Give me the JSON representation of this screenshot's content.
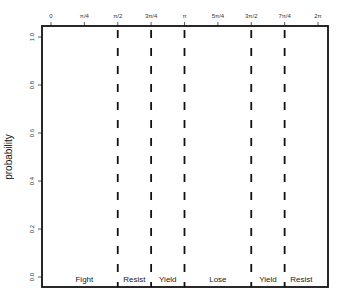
{
  "chart_data": {
    "type": "line",
    "title": "",
    "xlabel": "",
    "ylabel": "probability",
    "xlim": [
      0,
      6.2832
    ],
    "ylim": [
      0,
      1
    ],
    "grid": false,
    "legend": null,
    "x_ticks": [
      {
        "value": 0,
        "label": "0"
      },
      {
        "value": 0.7854,
        "label": "π/4"
      },
      {
        "value": 1.5708,
        "label": "π/2"
      },
      {
        "value": 2.3562,
        "label": "3π/4"
      },
      {
        "value": 3.1416,
        "label": "π"
      },
      {
        "value": 3.927,
        "label": "5π/4"
      },
      {
        "value": 4.7124,
        "label": "3π/2"
      },
      {
        "value": 5.4978,
        "label": "7π/4"
      },
      {
        "value": 6.2832,
        "label": "2π"
      }
    ],
    "y_ticks": [
      {
        "value": 0.0,
        "label": "0.0"
      },
      {
        "value": 0.2,
        "label": "0.2"
      },
      {
        "value": 0.4,
        "label": "0.4"
      },
      {
        "value": 0.6,
        "label": "0.6"
      },
      {
        "value": 0.8,
        "label": "0.8"
      },
      {
        "value": 1.0,
        "label": "1.0"
      }
    ],
    "vertical_dashed_lines": [
      1.5708,
      2.3562,
      3.1416,
      4.7124,
      5.4978
    ],
    "regions": [
      {
        "label": "Fight",
        "from": 0,
        "to": 1.5708
      },
      {
        "label": "Resist",
        "from": 1.5708,
        "to": 2.3562
      },
      {
        "label": "Yield",
        "from": 2.3562,
        "to": 3.1416
      },
      {
        "label": "Lose",
        "from": 3.1416,
        "to": 4.7124
      },
      {
        "label": "Yield",
        "from": 4.7124,
        "to": 5.4978
      },
      {
        "label": "Resist",
        "from": 5.4978,
        "to": 6.2832
      }
    ],
    "series": []
  },
  "colors": {
    "frame": "#111111",
    "dashed": "#111111",
    "text": "#333333"
  }
}
